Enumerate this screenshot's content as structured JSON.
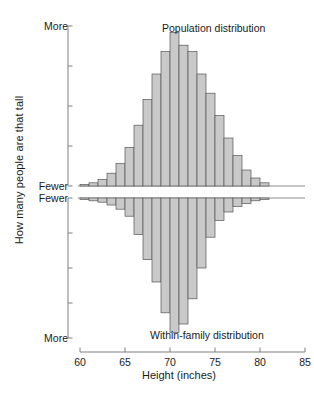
{
  "chart_data": {
    "type": "bar",
    "title": "",
    "subtitle": "",
    "xlabel": "Height (inches)",
    "ylabel": "How many people are that tall",
    "xlim": [
      60,
      85
    ],
    "xticks": [
      60,
      65,
      70,
      75,
      80,
      85
    ],
    "grid": false,
    "legend": "none",
    "orientation": "mirrored-vertical",
    "bin_width": 1,
    "bar_fill": "#c9c9c9",
    "bar_stroke": "#555555",
    "axis_color": "#808080",
    "panels": [
      {
        "name": "population",
        "annotation": "Population distribution",
        "direction": "up",
        "ytick_top_label": "More",
        "ytick_bottom_label": "Fewer",
        "ylim": [
          0,
          100
        ],
        "n_yticks": 5,
        "x": [
          60.5,
          61.5,
          62.5,
          63.5,
          64.5,
          65.5,
          66.5,
          67.5,
          68.5,
          69.5,
          70.5,
          71.5,
          72.5,
          73.5,
          74.5,
          75.5,
          76.5,
          77.5,
          78.5,
          79.5,
          80.5
        ],
        "values": [
          1,
          2,
          4,
          8,
          14,
          24,
          38,
          54,
          70,
          84,
          96,
          88,
          84,
          70,
          58,
          44,
          30,
          19,
          10,
          5,
          2
        ]
      },
      {
        "name": "within-family",
        "annotation": "Within-family distribution",
        "direction": "down",
        "ytick_top_label": "Fewer",
        "ytick_bottom_label": "More",
        "ylim": [
          0,
          100
        ],
        "n_yticks": 5,
        "x": [
          60.5,
          61.5,
          62.5,
          63.5,
          64.5,
          65.5,
          66.5,
          67.5,
          68.5,
          69.5,
          70.5,
          71.5,
          72.5,
          73.5,
          74.5,
          75.5,
          76.5,
          77.5,
          78.5,
          79.5,
          80.5
        ],
        "values": [
          1,
          2,
          3,
          5,
          8,
          13,
          26,
          44,
          60,
          82,
          96,
          90,
          72,
          50,
          28,
          16,
          10,
          6,
          4,
          2,
          1
        ]
      }
    ]
  },
  "axis": {
    "ylabel": "How many people are that tall",
    "xlabel": "Height (inches)",
    "xticks": [
      "60",
      "65",
      "70",
      "75",
      "80",
      "85"
    ],
    "ytick_labels": {
      "top_more": "More",
      "top_fewer": "Fewer",
      "bottom_fewer": "Fewer",
      "bottom_more": "More"
    }
  },
  "annotations": {
    "top_panel": "Population distribution",
    "bottom_panel": "Within-family distribution"
  }
}
